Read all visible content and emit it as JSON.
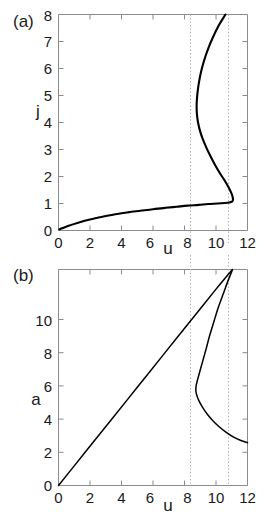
{
  "figure": {
    "panels": [
      {
        "label": "(a)",
        "xlabel": "u",
        "ylabel": "j",
        "xticks": [
          "0",
          "2",
          "4",
          "6",
          "8",
          "10",
          "12"
        ],
        "yticks": [
          "0",
          "1",
          "2",
          "3",
          "4",
          "5",
          "6",
          "7",
          "8"
        ]
      },
      {
        "label": "(b)",
        "xlabel": "u",
        "ylabel": "a",
        "xticks": [
          "0",
          "2",
          "4",
          "6",
          "8",
          "10",
          "12"
        ],
        "yticks": [
          "0",
          "2",
          "4",
          "6",
          "8",
          "10"
        ]
      }
    ]
  },
  "chart_data": [
    {
      "type": "line",
      "title": "",
      "panel": "(a)",
      "xlabel": "u",
      "ylabel": "j",
      "xlim": [
        0,
        12
      ],
      "ylim": [
        0,
        8
      ],
      "xticks": [
        0,
        2,
        4,
        6,
        8,
        10,
        12
      ],
      "yticks": [
        0,
        1,
        2,
        3,
        4,
        5,
        6,
        7,
        8
      ],
      "grid": false,
      "legend": null,
      "annotations": [
        {
          "type": "vline",
          "x": 8.7,
          "style": "dotted"
        },
        {
          "type": "vline",
          "x": 11.05,
          "style": "dotted"
        }
      ],
      "series": [
        {
          "name": "j(u) response curve",
          "points": [
            [
              0.05,
              0.04
            ],
            [
              0.6,
              0.17
            ],
            [
              1.3,
              0.3
            ],
            [
              2.0,
              0.41
            ],
            [
              2.8,
              0.51
            ],
            [
              3.6,
              0.6
            ],
            [
              4.4,
              0.67
            ],
            [
              5.2,
              0.73
            ],
            [
              6.0,
              0.79
            ],
            [
              6.8,
              0.84
            ],
            [
              7.5,
              0.88
            ],
            [
              8.2,
              0.92
            ],
            [
              8.9,
              0.95
            ],
            [
              9.5,
              0.98
            ],
            [
              10.1,
              1.0
            ],
            [
              10.55,
              1.02
            ],
            [
              10.85,
              1.04
            ],
            [
              11.02,
              1.07
            ],
            [
              11.08,
              1.14
            ],
            [
              11.05,
              1.26
            ],
            [
              10.95,
              1.42
            ],
            [
              10.78,
              1.62
            ],
            [
              10.55,
              1.85
            ],
            [
              10.25,
              2.12
            ],
            [
              9.95,
              2.42
            ],
            [
              9.65,
              2.75
            ],
            [
              9.38,
              3.08
            ],
            [
              9.15,
              3.4
            ],
            [
              8.98,
              3.7
            ],
            [
              8.86,
              4.0
            ],
            [
              8.79,
              4.3
            ],
            [
              8.77,
              4.6
            ],
            [
              8.8,
              4.95
            ],
            [
              8.88,
              5.35
            ],
            [
              9.02,
              5.8
            ],
            [
              9.22,
              6.25
            ],
            [
              9.48,
              6.7
            ],
            [
              9.8,
              7.15
            ],
            [
              10.18,
              7.6
            ],
            [
              10.6,
              8.0
            ]
          ]
        }
      ]
    },
    {
      "type": "line",
      "title": "",
      "panel": "(b)",
      "xlabel": "u",
      "ylabel": "a",
      "xlim": [
        0,
        12
      ],
      "ylim": [
        0,
        10
      ],
      "xticks": [
        0,
        2,
        4,
        6,
        8,
        10,
        12
      ],
      "yticks": [
        0,
        2,
        4,
        6,
        8,
        10
      ],
      "grid": false,
      "legend": null,
      "annotations": [
        {
          "type": "vline",
          "x": 8.7,
          "style": "dotted"
        },
        {
          "type": "vline",
          "x": 11.05,
          "style": "dotted"
        }
      ],
      "series": [
        {
          "name": "a(u) upper linear branch",
          "points": [
            [
              0.0,
              0.0
            ],
            [
              1.1,
              1.0
            ],
            [
              2.2,
              2.0
            ],
            [
              3.3,
              3.0
            ],
            [
              4.4,
              4.0
            ],
            [
              5.5,
              5.0
            ],
            [
              6.6,
              6.0
            ],
            [
              7.7,
              7.0
            ],
            [
              8.8,
              8.0
            ],
            [
              9.9,
              9.0
            ],
            [
              10.6,
              9.62
            ],
            [
              11.05,
              10.0
            ]
          ]
        },
        {
          "name": "a(u) folded lower branch",
          "points": [
            [
              11.05,
              10.0
            ],
            [
              10.75,
              9.45
            ],
            [
              10.45,
              8.85
            ],
            [
              10.15,
              8.25
            ],
            [
              9.88,
              7.62
            ],
            [
              9.62,
              7.0
            ],
            [
              9.4,
              6.4
            ],
            [
              9.18,
              5.82
            ],
            [
              8.98,
              5.3
            ],
            [
              8.83,
              4.9
            ],
            [
              8.74,
              4.62
            ],
            [
              8.72,
              4.4
            ],
            [
              8.78,
              4.18
            ],
            [
              8.92,
              3.92
            ],
            [
              9.15,
              3.62
            ],
            [
              9.45,
              3.3
            ],
            [
              9.8,
              3.0
            ],
            [
              10.2,
              2.72
            ],
            [
              10.65,
              2.46
            ],
            [
              11.12,
              2.24
            ],
            [
              11.58,
              2.08
            ],
            [
              12.0,
              1.98
            ]
          ]
        }
      ]
    }
  ]
}
